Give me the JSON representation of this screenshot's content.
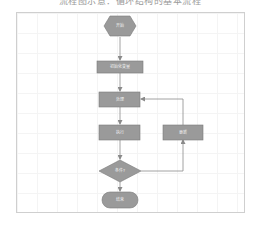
{
  "caption": "流程图示意：循环结构的基本流程",
  "colors": {
    "node_fill": "#9a9a9a",
    "node_stroke": "#7a7a7a",
    "edge": "#8a8a8a",
    "canvas_border": "#cfcfcf",
    "grid": "#f4f4f4"
  },
  "nodes": {
    "start": {
      "shape": "hexagon",
      "label": "开始"
    },
    "init": {
      "shape": "rect",
      "label": "初始化变量"
    },
    "step1": {
      "shape": "rect",
      "label": "处理"
    },
    "step2": {
      "shape": "rect",
      "label": "执行"
    },
    "update": {
      "shape": "rect",
      "label": "更新"
    },
    "decision": {
      "shape": "diamond",
      "label": "条件?"
    },
    "end": {
      "shape": "terminal",
      "label": "结束"
    }
  },
  "edges": [
    {
      "from": "start",
      "to": "init"
    },
    {
      "from": "init",
      "to": "step1"
    },
    {
      "from": "step1",
      "to": "step2"
    },
    {
      "from": "step2",
      "to": "decision"
    },
    {
      "from": "decision",
      "to": "end"
    },
    {
      "from": "decision",
      "to": "update"
    },
    {
      "from": "update",
      "to": "step1"
    }
  ]
}
